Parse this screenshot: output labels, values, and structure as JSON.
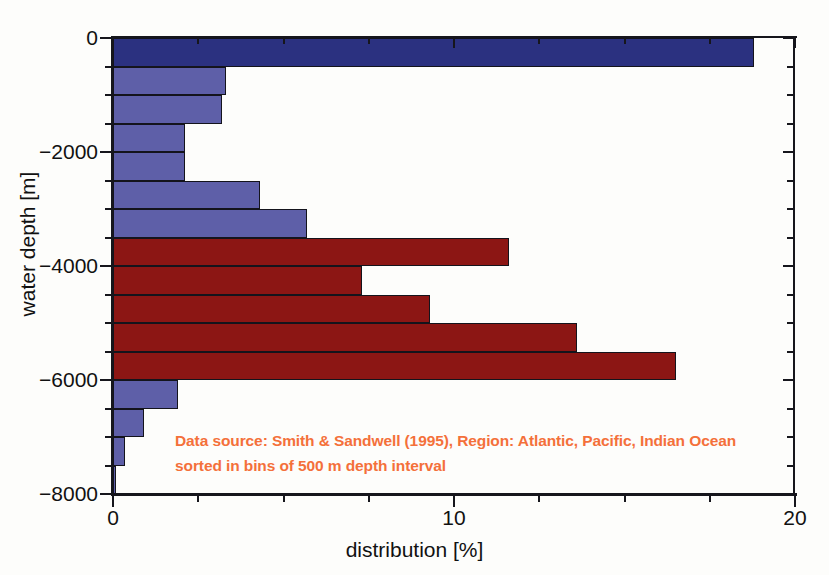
{
  "chart_data": {
    "type": "bar",
    "orientation": "horizontal",
    "title": "",
    "xlabel": "distribution [%]",
    "ylabel": "water depth [m]",
    "xlim": [
      0,
      20
    ],
    "ylim": [
      -8000,
      0
    ],
    "xticks": [
      0,
      10,
      20
    ],
    "xtick_labels": [
      "0",
      "10",
      "20"
    ],
    "x_minor_tick_interval": 2.5,
    "yticks": [
      0,
      -2000,
      -4000,
      -6000,
      -8000
    ],
    "ytick_labels": [
      "0",
      "−2000",
      "−4000",
      "−6000",
      "−8000"
    ],
    "y_minor_tick_interval": 500,
    "grid": false,
    "legend": false,
    "bin_width_m": 500,
    "categories": [
      "0 to -500",
      "-500 to -1000",
      "-1000 to -1500",
      "-1500 to -2000",
      "-2000 to -2500",
      "-2500 to -3000",
      "-3000 to -3500",
      "-3500 to -4000",
      "-4000 to -4500",
      "-4500 to -5000",
      "-5000 to -5500",
      "-5500 to -6000",
      "-6000 to -6500",
      "-6500 to -7000",
      "-7000 to -7500",
      "-7500 to -8000"
    ],
    "values": [
      18.8,
      3.3,
      3.2,
      2.1,
      2.1,
      4.3,
      5.7,
      11.6,
      7.3,
      9.3,
      13.6,
      16.5,
      1.9,
      0.9,
      0.35,
      0.1
    ],
    "bins": [
      {
        "top": 0,
        "bottom": -500,
        "value": 18.8,
        "color": "#2b3180"
      },
      {
        "top": -500,
        "bottom": -1000,
        "value": 3.3,
        "color": "#5e5fa8"
      },
      {
        "top": -1000,
        "bottom": -1500,
        "value": 3.2,
        "color": "#5e5fa8"
      },
      {
        "top": -1500,
        "bottom": -2000,
        "value": 2.1,
        "color": "#5e5fa8"
      },
      {
        "top": -2000,
        "bottom": -2500,
        "value": 2.1,
        "color": "#5e5fa8"
      },
      {
        "top": -2500,
        "bottom": -3000,
        "value": 4.3,
        "color": "#5e5fa8"
      },
      {
        "top": -3000,
        "bottom": -3500,
        "value": 5.7,
        "color": "#5e5fa8"
      },
      {
        "top": -3500,
        "bottom": -4000,
        "value": 11.6,
        "color": "#8c1614"
      },
      {
        "top": -4000,
        "bottom": -4500,
        "value": 7.3,
        "color": "#8c1614"
      },
      {
        "top": -4500,
        "bottom": -5000,
        "value": 9.3,
        "color": "#8c1614"
      },
      {
        "top": -5000,
        "bottom": -5500,
        "value": 13.6,
        "color": "#8c1614"
      },
      {
        "top": -5500,
        "bottom": -6000,
        "value": 16.5,
        "color": "#8c1614"
      },
      {
        "top": -6000,
        "bottom": -6500,
        "value": 1.9,
        "color": "#5e5fa8"
      },
      {
        "top": -6500,
        "bottom": -7000,
        "value": 0.9,
        "color": "#5e5fa8"
      },
      {
        "top": -7000,
        "bottom": -7500,
        "value": 0.35,
        "color": "#5e5fa8"
      },
      {
        "top": -7500,
        "bottom": -8000,
        "value": 0.1,
        "color": "#5e5fa8"
      }
    ],
    "annotations": [
      "Data source: Smith & Sandwell (1995), Region: Atlantic, Pacific, Indian Ocean",
      "sorted in bins of 500 m depth interval"
    ],
    "colors": {
      "shelf_blue": "#2b3180",
      "slope_blue": "#5e5fa8",
      "abyssal_red": "#8c1614",
      "annotation_orange": "#f4703a",
      "axis": "#16161c",
      "background": "#fdfdfb"
    }
  }
}
